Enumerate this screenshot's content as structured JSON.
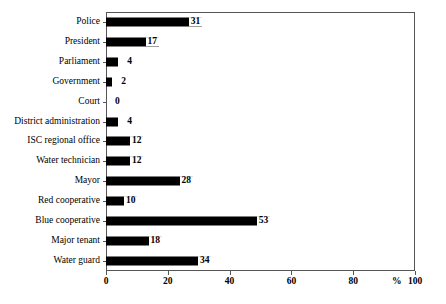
{
  "chart_data": {
    "type": "bar",
    "orientation": "horizontal",
    "title": "",
    "subtitle": "",
    "xlabel": "%",
    "ylabel": "",
    "xlim": [
      0,
      100
    ],
    "ylim": null,
    "grid": false,
    "legend": null,
    "xticks": [
      0,
      20,
      40,
      60,
      80,
      100
    ],
    "xtick_labels": [
      "0",
      "20",
      "40",
      "60",
      "80",
      "100"
    ],
    "categories": [
      "Police",
      "President",
      "Parliament",
      "Government",
      "Court",
      "District administration",
      "ISC regional office",
      "Water technician",
      "Mayor",
      "Red cooperative",
      "Blue cooperative",
      "Major tenant",
      "Water guard"
    ],
    "values": [
      31,
      17,
      4,
      2,
      0,
      4,
      12,
      12,
      28,
      10,
      53,
      18,
      34
    ],
    "value_labels": [
      "31",
      "17",
      "4",
      "2",
      "0",
      "4",
      "12",
      "12",
      "28",
      "10",
      "53",
      "18",
      "34"
    ],
    "bar_color": "#000000",
    "axis_color": "#555555",
    "background_color": "#ffffff"
  },
  "axis": {
    "percent_symbol": "%"
  }
}
